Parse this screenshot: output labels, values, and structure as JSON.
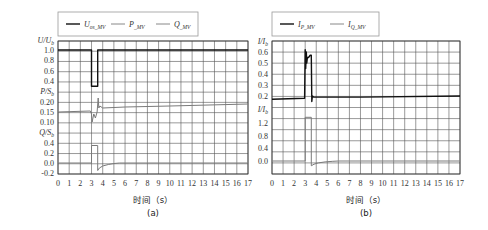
{
  "chart_data": [
    {
      "id": "a",
      "type": "line",
      "caption": "(a)",
      "xlabel": "时间（s）",
      "x_ticks": [
        "0",
        "1",
        "2",
        "3",
        "4",
        "5",
        "6",
        "7",
        "8",
        "9",
        "10",
        "11",
        "12",
        "13",
        "14",
        "15",
        "16",
        "17"
      ],
      "xlim": [
        0,
        17
      ],
      "grid": true,
      "legend": {
        "position": "top",
        "entries": [
          {
            "name": "U_os_MV",
            "main": "U",
            "sub": "os_MV",
            "color": "#111111"
          },
          {
            "name": "P_MV",
            "main": "P",
            "sub": "_MV",
            "color": "#888888"
          },
          {
            "name": "Q_MV",
            "main": "Q",
            "sub": "_MV",
            "color": "#888888"
          }
        ]
      },
      "panels": [
        {
          "ylabel_main": "U/U",
          "ylabel_sub": "b",
          "ticks": [
            {
              "label": "1.0",
              "v": 1.0
            },
            {
              "label": "0.8",
              "v": 0.8
            },
            {
              "label": "0.6",
              "v": 0.6
            },
            {
              "label": "0.4",
              "v": 0.4
            }
          ],
          "series": [
            {
              "name": "U_os_MV",
              "color": "#111111",
              "width": 1.4,
              "x": [
                0,
                3.0,
                3.0,
                3.55,
                3.55,
                17
              ],
              "y": [
                1.0,
                1.0,
                0.3,
                0.3,
                1.0,
                1.0
              ]
            }
          ]
        },
        {
          "ylabel_main": "P/S",
          "ylabel_sub": "b",
          "ticks": [
            {
              "label": "0.20",
              "v": 0.2
            },
            {
              "label": "0.15",
              "v": 0.15
            },
            {
              "label": "0.10",
              "v": 0.1
            }
          ],
          "series": [
            {
              "name": "P_MV",
              "color": "#7a7a7a",
              "width": 1.0,
              "x": [
                0,
                2.9,
                3.0,
                3.05,
                3.2,
                3.35,
                3.5,
                3.6,
                3.65,
                3.75,
                4,
                6,
                10,
                17
              ],
              "y": [
                0.15,
                0.155,
                0.14,
                0.1,
                0.14,
                0.12,
                0.15,
                0.22,
                0.17,
                0.18,
                0.17,
                0.175,
                0.18,
                0.19
              ]
            }
          ]
        },
        {
          "ylabel_main": "Q/S",
          "ylabel_sub": "b",
          "ticks": [
            {
              "label": "0.4",
              "v": 0.4
            },
            {
              "label": "0.2",
              "v": 0.2
            },
            {
              "label": "0.0",
              "v": 0.0
            },
            {
              "label": "-0.2",
              "v": -0.2
            }
          ],
          "series": [
            {
              "name": "Q_MV",
              "color": "#7a7a7a",
              "width": 1.0,
              "x": [
                0,
                3.0,
                3.0,
                3.55,
                3.55,
                3.7,
                4.0,
                4.5,
                5.0,
                5.5,
                6.0,
                17
              ],
              "y": [
                0.0,
                0.0,
                0.35,
                0.35,
                -0.15,
                -0.1,
                -0.06,
                -0.03,
                -0.01,
                0.0,
                0.0,
                0.0
              ]
            }
          ]
        }
      ]
    },
    {
      "id": "b",
      "type": "line",
      "caption": "(b)",
      "xlabel": "时间（s）",
      "x_ticks": [
        "0",
        "1",
        "2",
        "3",
        "4",
        "5",
        "6",
        "7",
        "8",
        "9",
        "10",
        "11",
        "12",
        "13",
        "14",
        "15",
        "16",
        "17"
      ],
      "xlim": [
        0,
        17
      ],
      "grid": true,
      "legend": {
        "position": "top",
        "entries": [
          {
            "name": "I_P_MV",
            "main": "I",
            "sub": "P_MV",
            "color": "#111111"
          },
          {
            "name": "I_Q_MV",
            "main": "I",
            "sub": "Q_MV",
            "color": "#888888"
          }
        ]
      },
      "panels": [
        {
          "ylabel_main": "I/I",
          "ylabel_sub": "b",
          "ticks": [
            {
              "label": "0.6",
              "v": 0.6
            },
            {
              "label": "0.5",
              "v": 0.5
            },
            {
              "label": "0.4",
              "v": 0.4
            },
            {
              "label": "0.3",
              "v": 0.3
            },
            {
              "label": "0.2",
              "v": 0.2
            }
          ],
          "series": [
            {
              "name": "I_P_MV",
              "color": "#111111",
              "width": 1.4,
              "x": [
                0,
                2.95,
                3.0,
                3.05,
                3.1,
                3.15,
                3.2,
                3.3,
                3.45,
                3.55,
                3.6,
                3.65,
                3.75,
                4,
                8,
                17
              ],
              "y": [
                0.17,
                0.18,
                0.62,
                0.45,
                0.6,
                0.5,
                0.55,
                0.55,
                0.57,
                0.57,
                0.15,
                0.2,
                0.19,
                0.19,
                0.19,
                0.2
              ]
            }
          ]
        },
        {
          "ylabel_main": "I/I",
          "ylabel_sub": "b",
          "ticks": [
            {
              "label": "1.2",
              "v": 1.2
            },
            {
              "label": "0.8",
              "v": 0.8
            },
            {
              "label": "0.4",
              "v": 0.4
            },
            {
              "label": "0.0",
              "v": 0.0
            }
          ],
          "series": [
            {
              "name": "I_Q_MV",
              "color": "#7a7a7a",
              "width": 1.0,
              "x": [
                0,
                3.0,
                3.0,
                3.55,
                3.55,
                3.8,
                4.2,
                4.8,
                5.5,
                6.0,
                17
              ],
              "y": [
                0.0,
                0.0,
                1.38,
                1.38,
                -0.15,
                -0.1,
                -0.06,
                -0.03,
                -0.01,
                0.0,
                0.0
              ]
            }
          ]
        }
      ]
    }
  ]
}
